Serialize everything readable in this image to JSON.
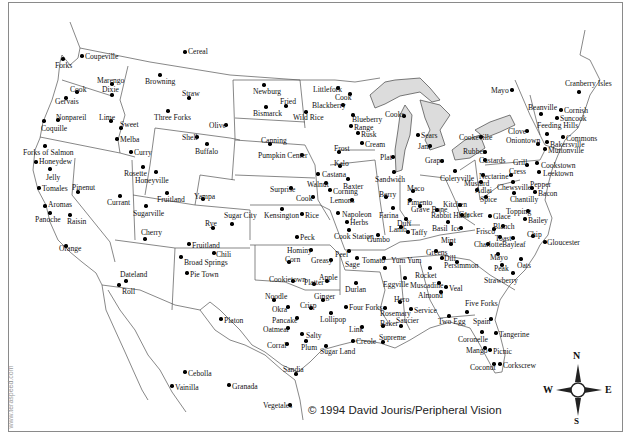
{
  "credit": "© 1994 David Jouris/Peripheral Vision",
  "watermark": "www.teraspeed.com",
  "compass": {
    "n": "N",
    "s": "S",
    "e": "E",
    "w": "W"
  },
  "colors": {
    "lakes": "#dcdcdc",
    "border": "#555555",
    "frame": "#8a8a8a"
  },
  "places": [
    {
      "name": "Coupeville",
      "x": 82,
      "y": 56,
      "lx": 85,
      "ly": 53
    },
    {
      "name": "Forks",
      "x": 63,
      "y": 59,
      "lx": 55,
      "ly": 62
    },
    {
      "name": "Cereal",
      "x": 185,
      "y": 52,
      "lx": 188,
      "ly": 48
    },
    {
      "name": "Marengo",
      "x": 112,
      "y": 84,
      "lx": 97,
      "ly": 77
    },
    {
      "name": "Dixie",
      "x": 112,
      "y": 95,
      "lx": 102,
      "ly": 86
    },
    {
      "name": "Cook",
      "x": 77,
      "y": 92,
      "lx": 70,
      "ly": 86
    },
    {
      "name": "Gervais",
      "x": 66,
      "y": 98,
      "lx": 55,
      "ly": 98
    },
    {
      "name": "Browning",
      "x": 160,
      "y": 75,
      "lx": 145,
      "ly": 78
    },
    {
      "name": "Straw",
      "x": 189,
      "y": 98,
      "lx": 182,
      "ly": 90
    },
    {
      "name": "Three Forks",
      "x": 168,
      "y": 111,
      "lx": 154,
      "ly": 114
    },
    {
      "name": "Olive",
      "x": 226,
      "y": 125,
      "lx": 209,
      "ly": 122
    },
    {
      "name": "Newburg",
      "x": 264,
      "y": 85,
      "lx": 253,
      "ly": 88
    },
    {
      "name": "Fried",
      "x": 286,
      "y": 106,
      "lx": 280,
      "ly": 98
    },
    {
      "name": "Bismarck",
      "x": 266,
      "y": 107,
      "lx": 253,
      "ly": 110
    },
    {
      "name": "Wild Rice",
      "x": 306,
      "y": 112,
      "lx": 293,
      "ly": 114
    },
    {
      "name": "Littlefork",
      "x": 338,
      "y": 88,
      "lx": 313,
      "ly": 86
    },
    {
      "name": "Cook",
      "x": 350,
      "y": 94,
      "lx": 335,
      "ly": 94
    },
    {
      "name": "Blackberry",
      "x": 343,
      "y": 105,
      "lx": 312,
      "ly": 102
    },
    {
      "name": "Nonpareil",
      "x": 58,
      "y": 120,
      "lx": 56,
      "ly": 114
    },
    {
      "name": "Coquille",
      "x": 44,
      "y": 121,
      "lx": 41,
      "ly": 125
    },
    {
      "name": "Lime",
      "x": 111,
      "y": 121,
      "lx": 99,
      "ly": 114
    },
    {
      "name": "Sweet",
      "x": 121,
      "y": 128,
      "lx": 120,
      "ly": 121
    },
    {
      "name": "Melba",
      "x": 117,
      "y": 139,
      "lx": 120,
      "ly": 136
    },
    {
      "name": "Curry",
      "x": 131,
      "y": 152,
      "lx": 134,
      "ly": 149
    },
    {
      "name": "Shell",
      "x": 197,
      "y": 137,
      "lx": 182,
      "ly": 134
    },
    {
      "name": "Buffalo",
      "x": 207,
      "y": 144,
      "lx": 195,
      "ly": 148
    },
    {
      "name": "Canning",
      "x": 270,
      "y": 144,
      "lx": 261,
      "ly": 137
    },
    {
      "name": "Pumpkin Center",
      "x": 302,
      "y": 155,
      "lx": 258,
      "ly": 152
    },
    {
      "name": "Blueberry",
      "x": 353,
      "y": 115,
      "lx": 352,
      "ly": 116
    },
    {
      "name": "Range",
      "x": 351,
      "y": 126,
      "lx": 354,
      "ly": 124
    },
    {
      "name": "Rusk",
      "x": 358,
      "y": 133,
      "lx": 361,
      "ly": 131
    },
    {
      "name": "Cream",
      "x": 362,
      "y": 143,
      "lx": 365,
      "ly": 141
    },
    {
      "name": "Cooks",
      "x": 404,
      "y": 116,
      "lx": 385,
      "ly": 111
    },
    {
      "name": "Sears",
      "x": 418,
      "y": 135,
      "lx": 421,
      "ly": 132
    },
    {
      "name": "Jam",
      "x": 430,
      "y": 146,
      "lx": 418,
      "ly": 143
    },
    {
      "name": "Plat",
      "x": 393,
      "y": 157,
      "lx": 380,
      "ly": 154
    },
    {
      "name": "Frost",
      "x": 339,
      "y": 152,
      "lx": 334,
      "ly": 145
    },
    {
      "name": "Forks of Salmon",
      "x": 45,
      "y": 146,
      "lx": 23,
      "ly": 149
    },
    {
      "name": "Honeydew",
      "x": 36,
      "y": 162,
      "lx": 39,
      "ly": 158
    },
    {
      "name": "Jelly",
      "x": 50,
      "y": 169,
      "lx": 46,
      "ly": 174
    },
    {
      "name": "Tomales",
      "x": 39,
      "y": 188,
      "lx": 42,
      "ly": 185
    },
    {
      "name": "Aromas",
      "x": 45,
      "y": 206,
      "lx": 48,
      "ly": 201
    },
    {
      "name": "Panoche",
      "x": 50,
      "y": 213,
      "lx": 35,
      "ly": 216
    },
    {
      "name": "Pinenut",
      "x": 78,
      "y": 192,
      "lx": 72,
      "ly": 184
    },
    {
      "name": "Raisin",
      "x": 70,
      "y": 215,
      "lx": 67,
      "ly": 218
    },
    {
      "name": "Currant",
      "x": 120,
      "y": 196,
      "lx": 107,
      "ly": 199
    },
    {
      "name": "Rosette",
      "x": 143,
      "y": 167,
      "lx": 124,
      "ly": 170
    },
    {
      "name": "Honeyville",
      "x": 156,
      "y": 172,
      "lx": 135,
      "ly": 177
    },
    {
      "name": "Fruitland",
      "x": 167,
      "y": 193,
      "lx": 157,
      "ly": 196
    },
    {
      "name": "Sugarville",
      "x": 146,
      "y": 206,
      "lx": 133,
      "ly": 210
    },
    {
      "name": "Yampa",
      "x": 203,
      "y": 199,
      "lx": 194,
      "ly": 193
    },
    {
      "name": "Sugar City",
      "x": 232,
      "y": 224,
      "lx": 224,
      "ly": 212
    },
    {
      "name": "Rye",
      "x": 213,
      "y": 228,
      "lx": 205,
      "ly": 220
    },
    {
      "name": "Surprise",
      "x": 291,
      "y": 188,
      "lx": 270,
      "ly": 186
    },
    {
      "name": "Kalo",
      "x": 340,
      "y": 166,
      "lx": 334,
      "ly": 160
    },
    {
      "name": "Castana",
      "x": 318,
      "y": 174,
      "lx": 322,
      "ly": 171
    },
    {
      "name": "Baxter",
      "x": 348,
      "y": 179,
      "lx": 343,
      "ly": 183
    },
    {
      "name": "Walnut",
      "x": 326,
      "y": 183,
      "lx": 307,
      "ly": 181
    },
    {
      "name": "Corning",
      "x": 330,
      "y": 190,
      "lx": 333,
      "ly": 188
    },
    {
      "name": "Cook",
      "x": 313,
      "y": 197,
      "lx": 296,
      "ly": 195
    },
    {
      "name": "Lemons",
      "x": 352,
      "y": 200,
      "lx": 330,
      "ly": 197
    },
    {
      "name": "Sandwich",
      "x": 394,
      "y": 172,
      "lx": 375,
      "ly": 176
    },
    {
      "name": "Grape",
      "x": 442,
      "y": 161,
      "lx": 425,
      "ly": 157
    },
    {
      "name": "Coleryville",
      "x": 455,
      "y": 171,
      "lx": 440,
      "ly": 175
    },
    {
      "name": "Kensington",
      "x": 282,
      "y": 209,
      "lx": 264,
      "ly": 212
    },
    {
      "name": "Rice",
      "x": 302,
      "y": 214,
      "lx": 305,
      "ly": 212
    },
    {
      "name": "Peck",
      "x": 297,
      "y": 237,
      "lx": 300,
      "ly": 234
    },
    {
      "name": "Napoleon",
      "x": 338,
      "y": 213,
      "lx": 342,
      "ly": 211
    },
    {
      "name": "Herbs",
      "x": 347,
      "y": 222,
      "lx": 350,
      "ly": 219
    },
    {
      "name": "Cook Station",
      "x": 349,
      "y": 230,
      "lx": 334,
      "ly": 233
    },
    {
      "name": "Gumbo",
      "x": 378,
      "y": 235,
      "lx": 367,
      "ly": 236
    },
    {
      "name": "Berry",
      "x": 386,
      "y": 197,
      "lx": 379,
      "ly": 191
    },
    {
      "name": "Farina",
      "x": 393,
      "y": 208,
      "lx": 379,
      "ly": 212
    },
    {
      "name": "Maco",
      "x": 413,
      "y": 191,
      "lx": 407,
      "ly": 185
    },
    {
      "name": "Pimento",
      "x": 410,
      "y": 200,
      "lx": 407,
      "ly": 199
    },
    {
      "name": "Grave Bone",
      "x": 420,
      "y": 206,
      "lx": 411,
      "ly": 206
    },
    {
      "name": "Duff",
      "x": 406,
      "y": 219,
      "lx": 397,
      "ly": 220
    },
    {
      "name": "Lamb",
      "x": 401,
      "y": 227,
      "lx": 389,
      "ly": 226
    },
    {
      "name": "Taffy",
      "x": 408,
      "y": 232,
      "lx": 411,
      "ly": 229
    },
    {
      "name": "Kitchen",
      "x": 460,
      "y": 205,
      "lx": 443,
      "ly": 201
    },
    {
      "name": "Rabbit Hash",
      "x": 437,
      "y": 210,
      "lx": 431,
      "ly": 212
    },
    {
      "name": "Cracker",
      "x": 462,
      "y": 215,
      "lx": 459,
      "ly": 211
    },
    {
      "name": "Basil",
      "x": 448,
      "y": 222,
      "lx": 432,
      "ly": 225
    },
    {
      "name": "Ice",
      "x": 461,
      "y": 228,
      "lx": 451,
      "ly": 225
    },
    {
      "name": "Mint",
      "x": 451,
      "y": 244,
      "lx": 441,
      "ly": 237
    },
    {
      "name": "Greens",
      "x": 436,
      "y": 251,
      "lx": 426,
      "ly": 249
    },
    {
      "name": "Dill",
      "x": 442,
      "y": 258,
      "lx": 444,
      "ly": 255
    },
    {
      "name": "Persimmon",
      "x": 457,
      "y": 262,
      "lx": 444,
      "ly": 262
    },
    {
      "name": "Cookeville",
      "x": 481,
      "y": 137,
      "lx": 459,
      "ly": 134
    },
    {
      "name": "Rubber",
      "x": 485,
      "y": 152,
      "lx": 463,
      "ly": 148
    },
    {
      "name": "Custards",
      "x": 485,
      "y": 160,
      "lx": 479,
      "ly": 157
    },
    {
      "name": "Nectarine",
      "x": 483,
      "y": 175,
      "lx": 479,
      "ly": 173
    },
    {
      "name": "Mustard",
      "x": 481,
      "y": 182,
      "lx": 464,
      "ly": 180
    },
    {
      "name": "Adlai",
      "x": 477,
      "y": 190,
      "lx": 475,
      "ly": 187
    },
    {
      "name": "Spice",
      "x": 486,
      "y": 197,
      "lx": 480,
      "ly": 196
    },
    {
      "name": "Glace",
      "x": 490,
      "y": 216,
      "lx": 493,
      "ly": 213
    },
    {
      "name": "Frisco",
      "x": 494,
      "y": 229,
      "lx": 476,
      "ly": 228
    },
    {
      "name": "Blanch",
      "x": 503,
      "y": 226,
      "lx": 493,
      "ly": 223
    },
    {
      "name": "Toast",
      "x": 500,
      "y": 237,
      "lx": 495,
      "ly": 235
    },
    {
      "name": "Charlotte",
      "x": 488,
      "y": 244,
      "lx": 474,
      "ly": 241
    },
    {
      "name": "Mayo",
      "x": 498,
      "y": 254,
      "lx": 490,
      "ly": 254
    },
    {
      "name": "Peak",
      "x": 502,
      "y": 265,
      "lx": 494,
      "ly": 265
    },
    {
      "name": "Oats",
      "x": 521,
      "y": 259,
      "lx": 517,
      "ly": 262
    },
    {
      "name": "Strawberry",
      "x": 513,
      "y": 273,
      "lx": 484,
      "ly": 277
    },
    {
      "name": "Bayleaf",
      "x": 513,
      "y": 238,
      "lx": 502,
      "ly": 241
    },
    {
      "name": "Chip",
      "x": 533,
      "y": 236,
      "lx": 527,
      "ly": 231
    },
    {
      "name": "Gloucester",
      "x": 545,
      "y": 242,
      "lx": 547,
      "ly": 239
    },
    {
      "name": "Mayo",
      "x": 512,
      "y": 90,
      "lx": 491,
      "ly": 87
    },
    {
      "name": "Cranberry Isles",
      "x": 579,
      "y": 92,
      "lx": 565,
      "ly": 80
    },
    {
      "name": "Beanville",
      "x": 541,
      "y": 114,
      "lx": 528,
      "ly": 104
    },
    {
      "name": "Cornish",
      "x": 561,
      "y": 110,
      "lx": 564,
      "ly": 107
    },
    {
      "name": "Suncook",
      "x": 557,
      "y": 118,
      "lx": 560,
      "ly": 115
    },
    {
      "name": "Feeding Hills",
      "x": 547,
      "y": 134,
      "lx": 537,
      "ly": 122
    },
    {
      "name": "Clove",
      "x": 527,
      "y": 131,
      "lx": 508,
      "ly": 128
    },
    {
      "name": "Oniontown",
      "x": 538,
      "y": 144,
      "lx": 506,
      "ly": 137
    },
    {
      "name": "Commons",
      "x": 563,
      "y": 137,
      "lx": 566,
      "ly": 135
    },
    {
      "name": "Bakersville",
      "x": 547,
      "y": 142,
      "lx": 550,
      "ly": 141
    },
    {
      "name": "Muttonville",
      "x": 545,
      "y": 149,
      "lx": 548,
      "ly": 147
    },
    {
      "name": "Grill",
      "x": 527,
      "y": 165,
      "lx": 513,
      "ly": 159
    },
    {
      "name": "Cookstown",
      "x": 537,
      "y": 163,
      "lx": 541,
      "ly": 162
    },
    {
      "name": "Leektown",
      "x": 539,
      "y": 172,
      "lx": 543,
      "ly": 170
    },
    {
      "name": "Cress",
      "x": 511,
      "y": 175,
      "lx": 509,
      "ly": 168
    },
    {
      "name": "Chewsville",
      "x": 513,
      "y": 182,
      "lx": 497,
      "ly": 184
    },
    {
      "name": "Pepper",
      "x": 532,
      "y": 188,
      "lx": 530,
      "ly": 181
    },
    {
      "name": "Bacon",
      "x": 535,
      "y": 192,
      "lx": 538,
      "ly": 190
    },
    {
      "name": "Chantilly",
      "x": 514,
      "y": 193,
      "lx": 510,
      "ly": 196
    },
    {
      "name": "Topping",
      "x": 528,
      "y": 211,
      "lx": 506,
      "ly": 208
    },
    {
      "name": "Bailey",
      "x": 525,
      "y": 219,
      "lx": 528,
      "ly": 217
    },
    {
      "name": "Hominy",
      "x": 311,
      "y": 250,
      "lx": 287,
      "ly": 247
    },
    {
      "name": "Corn",
      "x": 289,
      "y": 262,
      "lx": 285,
      "ly": 256
    },
    {
      "name": "Greasy",
      "x": 331,
      "y": 260,
      "lx": 311,
      "ly": 257
    },
    {
      "name": "Peel",
      "x": 349,
      "y": 251,
      "lx": 335,
      "ly": 251
    },
    {
      "name": "Sage",
      "x": 357,
      "y": 258,
      "lx": 345,
      "ly": 261
    },
    {
      "name": "Tomato",
      "x": 384,
      "y": 258,
      "lx": 362,
      "ly": 257
    },
    {
      "name": "Yum Yum",
      "x": 385,
      "y": 268,
      "lx": 391,
      "ly": 257
    },
    {
      "name": "Cookietown",
      "x": 293,
      "y": 281,
      "lx": 269,
      "ly": 276
    },
    {
      "name": "Platter",
      "x": 314,
      "y": 284,
      "lx": 304,
      "ly": 279
    },
    {
      "name": "Apple",
      "x": 327,
      "y": 281,
      "lx": 319,
      "ly": 274
    },
    {
      "name": "Durlan",
      "x": 356,
      "y": 283,
      "lx": 345,
      "ly": 286
    },
    {
      "name": "Eggville",
      "x": 405,
      "y": 278,
      "lx": 383,
      "ly": 281
    },
    {
      "name": "Rocket",
      "x": 430,
      "y": 268,
      "lx": 415,
      "ly": 272
    },
    {
      "name": "Muscadine",
      "x": 439,
      "y": 283,
      "lx": 410,
      "ly": 282
    },
    {
      "name": "Veal",
      "x": 446,
      "y": 287,
      "lx": 449,
      "ly": 285
    },
    {
      "name": "Almond",
      "x": 441,
      "y": 292,
      "lx": 418,
      "ly": 292
    },
    {
      "name": "Noodle",
      "x": 274,
      "y": 300,
      "lx": 265,
      "ly": 293
    },
    {
      "name": "Ginger",
      "x": 323,
      "y": 300,
      "lx": 314,
      "ly": 293
    },
    {
      "name": "Okra",
      "x": 288,
      "y": 307,
      "lx": 272,
      "ly": 306
    },
    {
      "name": "Crisp",
      "x": 311,
      "y": 308,
      "lx": 300,
      "ly": 302
    },
    {
      "name": "Four Forks",
      "x": 346,
      "y": 307,
      "lx": 349,
      "ly": 304
    },
    {
      "name": "Lollipop",
      "x": 331,
      "y": 313,
      "lx": 320,
      "ly": 316
    },
    {
      "name": "Pancake",
      "x": 297,
      "y": 318,
      "lx": 272,
      "ly": 317
    },
    {
      "name": "Oatmeal",
      "x": 288,
      "y": 328,
      "lx": 263,
      "ly": 326
    },
    {
      "name": "Link",
      "x": 362,
      "y": 327,
      "lx": 349,
      "ly": 326
    },
    {
      "name": "Salty",
      "x": 302,
      "y": 334,
      "lx": 306,
      "ly": 332
    },
    {
      "name": "Corral",
      "x": 287,
      "y": 344,
      "lx": 267,
      "ly": 342
    },
    {
      "name": "Plum",
      "x": 306,
      "y": 341,
      "lx": 301,
      "ly": 344
    },
    {
      "name": "Sugar Land",
      "x": 326,
      "y": 346,
      "lx": 320,
      "ly": 348
    },
    {
      "name": "Creole",
      "x": 353,
      "y": 341,
      "lx": 356,
      "ly": 338
    },
    {
      "name": "Hero",
      "x": 400,
      "y": 302,
      "lx": 394,
      "ly": 296
    },
    {
      "name": "Rosemary",
      "x": 385,
      "y": 308,
      "lx": 380,
      "ly": 310
    },
    {
      "name": "Service",
      "x": 411,
      "y": 309,
      "lx": 414,
      "ly": 307
    },
    {
      "name": "Baker",
      "x": 383,
      "y": 326,
      "lx": 380,
      "ly": 320
    },
    {
      "name": "Saucier",
      "x": 401,
      "y": 326,
      "lx": 396,
      "ly": 317
    },
    {
      "name": "Supreme",
      "x": 383,
      "y": 342,
      "lx": 379,
      "ly": 334
    },
    {
      "name": "Two Egg",
      "x": 449,
      "y": 316,
      "lx": 438,
      "ly": 318
    },
    {
      "name": "Five Forks",
      "x": 467,
      "y": 312,
      "lx": 465,
      "ly": 300
    },
    {
      "name": "Spain",
      "x": 491,
      "y": 319,
      "lx": 473,
      "ly": 318
    },
    {
      "name": "Tangerine",
      "x": 496,
      "y": 333,
      "lx": 499,
      "ly": 331
    },
    {
      "name": "Coronelle",
      "x": 482,
      "y": 332,
      "lx": 458,
      "ly": 336
    },
    {
      "name": "Mango",
      "x": 485,
      "y": 348,
      "lx": 466,
      "ly": 347
    },
    {
      "name": "Picnic",
      "x": 490,
      "y": 350,
      "lx": 493,
      "ly": 348
    },
    {
      "name": "Coconut",
      "x": 494,
      "y": 364,
      "lx": 470,
      "ly": 364
    },
    {
      "name": "Corkscrew",
      "x": 500,
      "y": 364,
      "lx": 503,
      "ly": 362
    },
    {
      "name": "Cherry",
      "x": 145,
      "y": 239,
      "lx": 141,
      "ly": 229
    },
    {
      "name": "Dateland",
      "x": 126,
      "y": 281,
      "lx": 120,
      "ly": 271
    },
    {
      "name": "Roll",
      "x": 119,
      "y": 285,
      "lx": 122,
      "ly": 288
    },
    {
      "name": "Fruitland",
      "x": 189,
      "y": 244,
      "lx": 192,
      "ly": 242
    },
    {
      "name": "Chili",
      "x": 214,
      "y": 253,
      "lx": 216,
      "ly": 251
    },
    {
      "name": "Broad Springs",
      "x": 181,
      "y": 257,
      "lx": 184,
      "ly": 259
    },
    {
      "name": "Pie Town",
      "x": 187,
      "y": 273,
      "lx": 190,
      "ly": 271
    },
    {
      "name": "Orange",
      "x": 66,
      "y": 246,
      "lx": 59,
      "ly": 245
    },
    {
      "name": "Platon",
      "x": 221,
      "y": 319,
      "lx": 224,
      "ly": 317
    },
    {
      "name": "Cebolla",
      "x": 185,
      "y": 372,
      "lx": 188,
      "ly": 370
    },
    {
      "name": "Vainilla",
      "x": 172,
      "y": 386,
      "lx": 175,
      "ly": 384
    },
    {
      "name": "Granada",
      "x": 229,
      "y": 385,
      "lx": 232,
      "ly": 383
    },
    {
      "name": "Sandia",
      "x": 296,
      "y": 374,
      "lx": 283,
      "ly": 366
    },
    {
      "name": "Vegetales",
      "x": 290,
      "y": 405,
      "lx": 263,
      "ly": 402
    }
  ]
}
